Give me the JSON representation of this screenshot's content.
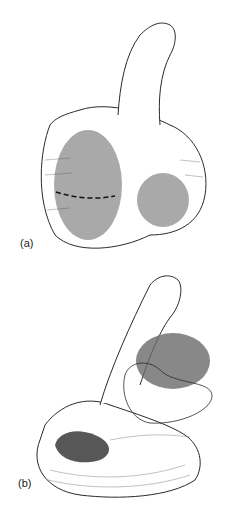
{
  "figure": {
    "panels": [
      {
        "id": "a",
        "label": "(a)"
      },
      {
        "id": "b",
        "label": "(b)"
      }
    ],
    "colors": {
      "line": "#2a2a2a",
      "shading_light": "#9a9a9a",
      "shading_dark": "#3a3a3a",
      "background": "#ffffff"
    }
  }
}
